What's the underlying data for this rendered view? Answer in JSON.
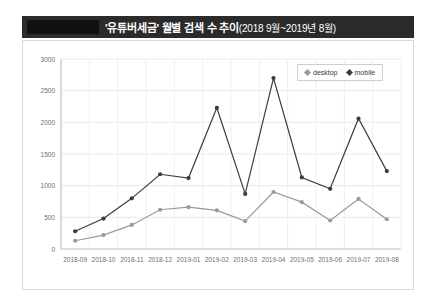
{
  "header": {
    "redacted_block": "",
    "title_main": "'유튜버세금' 월별 검색 수 추이",
    "title_range": "(2018 9월~2019년 8월)"
  },
  "legend": {
    "position": "top-right",
    "items": [
      {
        "label": "desktop",
        "color": "#9a9a9a",
        "marker": "diamond-marker-icon"
      },
      {
        "label": "mobile",
        "color": "#3c3c3c",
        "marker": "diamond-marker-icon"
      }
    ]
  },
  "chart_data": {
    "type": "line",
    "title": "'유튜버세금' 월별 검색 수 추이(2018 9월~2019년 8월)",
    "xlabel": "",
    "ylabel": "",
    "ylim": [
      0,
      3000
    ],
    "yticks": [
      0,
      500,
      1000,
      1500,
      2000,
      2500,
      3000
    ],
    "grid": true,
    "legend_position": "top-right",
    "categories": [
      "2018-09",
      "2018-10",
      "2018-11",
      "2018-12",
      "2019-01",
      "2019-02",
      "2019-03",
      "2019-04",
      "2019-05",
      "2019-06",
      "2019-07",
      "2019-08"
    ],
    "series": [
      {
        "name": "desktop",
        "color": "#9a9a9a",
        "values": [
          130,
          220,
          380,
          620,
          660,
          610,
          440,
          900,
          740,
          450,
          790,
          470
        ]
      },
      {
        "name": "mobile",
        "color": "#3c3c3c",
        "values": [
          280,
          480,
          800,
          1180,
          1120,
          2230,
          870,
          2700,
          1130,
          950,
          2060,
          1230
        ]
      }
    ]
  }
}
